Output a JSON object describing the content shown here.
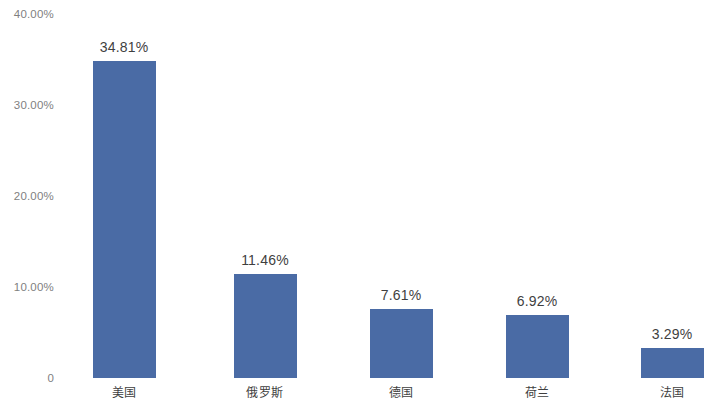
{
  "chart_data": {
    "type": "bar",
    "title": "",
    "subtitle": "",
    "xlabel": "",
    "ylabel": "",
    "categories": [
      "美国",
      "俄罗斯",
      "德国",
      "荷兰",
      "法国"
    ],
    "values": [
      34.81,
      11.46,
      7.61,
      6.92,
      3.29
    ],
    "value_labels": [
      "34.81%",
      "11.46%",
      "7.61%",
      "6.92%",
      "3.29%"
    ],
    "ylim": [
      0,
      40
    ],
    "y_ticks": [
      0,
      10,
      20,
      30,
      40
    ],
    "y_tick_labels": [
      "0",
      "10.00%",
      "20.00%",
      "30.00%",
      "40.00%"
    ],
    "grid": false,
    "legend": null,
    "legend_position": "none",
    "bar_color": "#4a6ba5",
    "background_color": "#ffffff",
    "value_label_color": "#3f3f3f",
    "tick_label_color": "#7f7f7f",
    "category_label_color": "#3f3f3f"
  },
  "geometry": {
    "baseline_y": 378,
    "top_value_y": 14,
    "bar_width": 63,
    "bar_centers_x": [
      124,
      265,
      401,
      537,
      672
    ]
  }
}
